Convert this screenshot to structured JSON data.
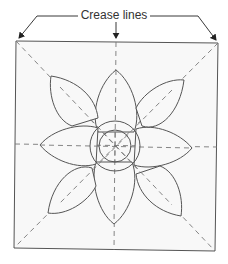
{
  "figure": {
    "annotation_label": "Crease lines",
    "colors": {
      "line": "#555555",
      "fill": "#f7f7f7",
      "dash": "#777777"
    },
    "petals": 8,
    "center_circles": 2
  }
}
